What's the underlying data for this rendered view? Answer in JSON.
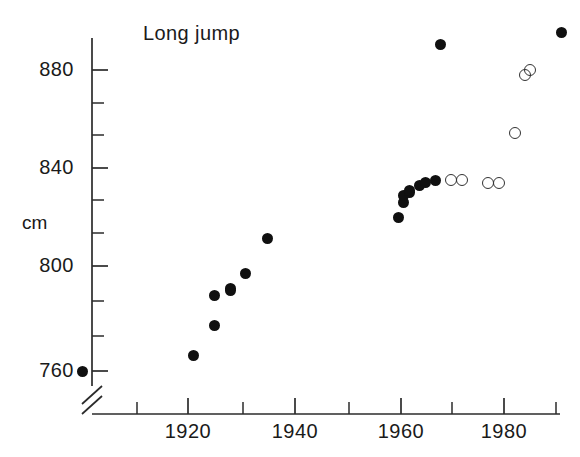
{
  "figure": {
    "title": "Long jump",
    "background": "#ffffff",
    "ink_color": "#101010"
  },
  "axes": {
    "y": {
      "label": "cm",
      "major_ticks": [
        760,
        800,
        840,
        880
      ],
      "major_tick_labels": [
        "760",
        "800",
        "840",
        "880"
      ],
      "minor_ticks": [
        770,
        780,
        790,
        810,
        820,
        830,
        850,
        860,
        870
      ],
      "range": [
        755,
        900
      ],
      "has_break": true,
      "break_note": "axis break below 760"
    },
    "x": {
      "label": "",
      "major_ticks": [
        1920,
        1940,
        1960,
        1980
      ],
      "major_tick_labels": [
        "1920",
        "1940",
        "1960",
        "1980"
      ],
      "minor_ticks": [
        1910,
        1930,
        1950,
        1970,
        1990
      ],
      "range": [
        1898,
        1992
      ],
      "has_break": true,
      "break_note": "axis break left of 1900"
    },
    "grid": false,
    "legend": false
  },
  "chart_data": {
    "type": "scatter",
    "title": "Long jump",
    "xlabel": "",
    "ylabel": "cm",
    "xlim": [
      1898,
      1992
    ],
    "ylim": [
      755,
      900
    ],
    "grid": false,
    "legend_position": "none",
    "series": [
      {
        "name": "filled",
        "marker": "filled-circle",
        "color": "#101010",
        "points": [
          {
            "x": 1900,
            "y": 760
          },
          {
            "x": 1921,
            "y": 766
          },
          {
            "x": 1925,
            "y": 778
          },
          {
            "x": 1925,
            "y": 790
          },
          {
            "x": 1928,
            "y": 792
          },
          {
            "x": 1928,
            "y": 793
          },
          {
            "x": 1931,
            "y": 799
          },
          {
            "x": 1935,
            "y": 813
          },
          {
            "x": 1960,
            "y": 821
          },
          {
            "x": 1961,
            "y": 827
          },
          {
            "x": 1961,
            "y": 830
          },
          {
            "x": 1962,
            "y": 831
          },
          {
            "x": 1962,
            "y": 832
          },
          {
            "x": 1964,
            "y": 834
          },
          {
            "x": 1965,
            "y": 835
          },
          {
            "x": 1967,
            "y": 836
          },
          {
            "x": 1968,
            "y": 890
          },
          {
            "x": 1991,
            "y": 895
          }
        ]
      },
      {
        "name": "open",
        "marker": "open-circle",
        "color": "#333333",
        "points": [
          {
            "x": 1970,
            "y": 836
          },
          {
            "x": 1972,
            "y": 836
          },
          {
            "x": 1977,
            "y": 835
          },
          {
            "x": 1979,
            "y": 835
          },
          {
            "x": 1982,
            "y": 855
          },
          {
            "x": 1984,
            "y": 878
          },
          {
            "x": 1985,
            "y": 880
          }
        ]
      }
    ]
  }
}
